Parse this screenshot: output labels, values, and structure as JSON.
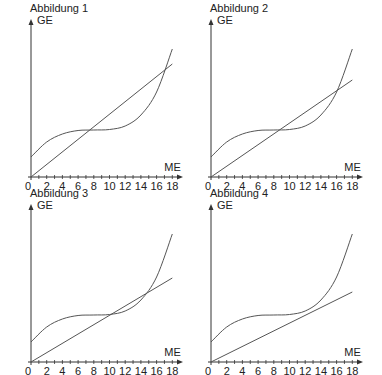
{
  "chart_data": [
    {
      "type": "line",
      "title": "Abbildung 1",
      "xlabel": "ME",
      "ylabel": "GE",
      "xlim": [
        0,
        18.6
      ],
      "xticks": [
        2,
        4,
        6,
        8,
        10,
        12,
        14,
        16,
        18
      ],
      "origin_label": "0",
      "grid": false,
      "series": [
        {
          "name": "Kostenfunktion K(x)",
          "kind": "cubic",
          "x": [
            0,
            2,
            4,
            6,
            8,
            10,
            12,
            14,
            16,
            18
          ],
          "y": [
            20,
            35,
            43,
            46.5,
            47,
            47.5,
            51,
            62,
            85,
            128
          ]
        },
        {
          "name": "Erlösfunktion E(x)",
          "kind": "linear",
          "x": [
            0,
            18
          ],
          "y": [
            0,
            113
          ]
        }
      ],
      "annotations": [
        "Schnittpunkte bei x ≈ 7.5 und x ≈ 17"
      ]
    },
    {
      "type": "line",
      "title": "Abbildung 2",
      "xlabel": "ME",
      "ylabel": "GE",
      "xlim": [
        0,
        18.6
      ],
      "xticks": [
        2,
        4,
        6,
        8,
        10,
        12,
        14,
        16,
        18
      ],
      "origin_label": "0",
      "grid": false,
      "series": [
        {
          "name": "Kostenfunktion K(x)",
          "kind": "cubic",
          "x": [
            0,
            2,
            4,
            6,
            8,
            10,
            12,
            14,
            16,
            18
          ],
          "y": [
            20,
            35,
            43,
            46.5,
            47,
            47.5,
            51,
            62,
            85,
            128
          ]
        },
        {
          "name": "Erlösfunktion E(x)",
          "kind": "linear",
          "x": [
            0,
            18
          ],
          "y": [
            0,
            97
          ]
        }
      ],
      "annotations": [
        "Schnittpunkte bei x ≈ 9 und x ≈ 15"
      ]
    },
    {
      "type": "line",
      "title": "Abbildung 3",
      "xlabel": "ME",
      "ylabel": "GE",
      "xlim": [
        0,
        18.6
      ],
      "xticks": [
        2,
        4,
        6,
        8,
        10,
        12,
        14,
        16,
        18
      ],
      "origin_label": "0",
      "grid": false,
      "series": [
        {
          "name": "Kostenfunktion K(x)",
          "kind": "cubic",
          "x": [
            0,
            2,
            4,
            6,
            8,
            10,
            12,
            14,
            16,
            18
          ],
          "y": [
            20,
            35,
            43,
            46.5,
            47,
            47.5,
            51,
            62,
            85,
            128
          ]
        },
        {
          "name": "Erlösfunktion E(x)",
          "kind": "linear",
          "x": [
            0,
            18
          ],
          "y": [
            0,
            84
          ]
        }
      ],
      "annotations": [
        "Berührpunkt bei x ≈ 12.5"
      ]
    },
    {
      "type": "line",
      "title": "Abbildung 4",
      "xlabel": "ME",
      "ylabel": "GE",
      "xlim": [
        0,
        18.6
      ],
      "xticks": [
        2,
        4,
        6,
        8,
        10,
        12,
        14,
        16,
        18
      ],
      "origin_label": "0",
      "grid": false,
      "series": [
        {
          "name": "Kostenfunktion K(x)",
          "kind": "cubic",
          "x": [
            0,
            2,
            4,
            6,
            8,
            10,
            12,
            14,
            16,
            18
          ],
          "y": [
            20,
            35,
            43,
            46.5,
            47,
            47.5,
            51,
            62,
            85,
            128
          ]
        },
        {
          "name": "Erlösfunktion E(x)",
          "kind": "linear",
          "x": [
            0,
            18
          ],
          "y": [
            0,
            70
          ]
        }
      ],
      "annotations": [
        "Kein Schnittpunkt"
      ]
    }
  ],
  "style": {
    "line_color": "#555555",
    "axis_color": "#333333",
    "text_color": "#222222"
  }
}
